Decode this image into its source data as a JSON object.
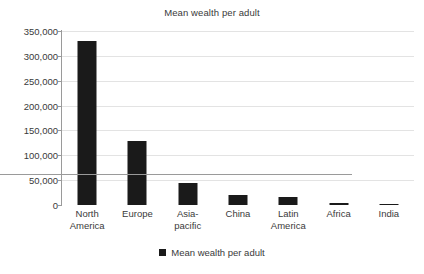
{
  "chart_data": {
    "type": "bar",
    "title": "Mean wealth per adult",
    "xlabel": "",
    "ylabel": "",
    "categories": [
      "North America",
      "Europe",
      "Asia-pacific",
      "China",
      "Latin America",
      "Africa",
      "India"
    ],
    "category_lines": [
      [
        "North",
        "America"
      ],
      [
        "Europe"
      ],
      [
        "Asia-",
        "pacific"
      ],
      [
        "China"
      ],
      [
        "Latin",
        "America"
      ],
      [
        "Africa"
      ],
      [
        "India"
      ]
    ],
    "values": [
      330000,
      129000,
      44000,
      20000,
      16000,
      4000,
      3000
    ],
    "series": [
      {
        "name": "Mean wealth per adult",
        "values": [
          330000,
          129000,
          44000,
          20000,
          16000,
          4000,
          3000
        ]
      }
    ],
    "ylim": [
      0,
      350000
    ],
    "ytick_values": [
      0,
      50000,
      100000,
      150000,
      200000,
      250000,
      300000,
      350000
    ],
    "ytick_labels": [
      "0",
      "50,000",
      "100,000",
      "150,000",
      "200,000",
      "250,000",
      "300,000",
      "350,000"
    ],
    "grid": true,
    "legend_position": "bottom",
    "legend_entries": [
      "Mean wealth per adult"
    ],
    "bar_color": "#1a1a1a",
    "gridline_color": "#e3e3e3",
    "axis_color": "#9a9a9a",
    "text_color": "#3a3a3a",
    "background_color": "#ffffff"
  },
  "legend": {
    "label": "Mean wealth per adult",
    "marker": "black-square-marker"
  }
}
